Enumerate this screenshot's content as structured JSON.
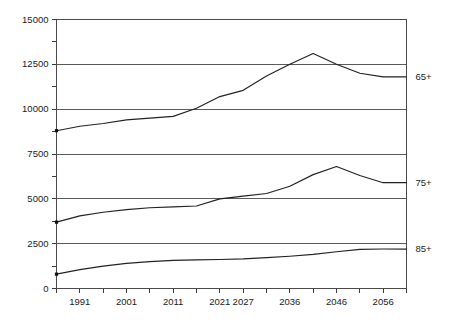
{
  "chart_data": {
    "type": "line",
    "title": "",
    "subtitle": "",
    "xlabel": "",
    "ylabel": "",
    "xlim": [
      1986,
      2061
    ],
    "ylim": [
      0,
      15000
    ],
    "grid": true,
    "grid_axis": "y",
    "legend_position": "right-of-plot-inline",
    "y_ticks_major": [
      0,
      2500,
      5000,
      7500,
      10000,
      12500,
      15000
    ],
    "y_tick_labels": [
      "0",
      "2500",
      "5000",
      "7500",
      "10000",
      "12500",
      "15000"
    ],
    "y_ticks_minor": [
      1250,
      3750,
      6250,
      8750,
      11250,
      13750
    ],
    "x_ticks": [
      1986,
      1991,
      1996,
      2001,
      2006,
      2011,
      2016,
      2021,
      2027,
      2031,
      2036,
      2041,
      2046,
      2051,
      2056,
      2061
    ],
    "x_tick_labels_shown": [
      "1991",
      "2001",
      "2011",
      "2021",
      "2027",
      "2036",
      "2046",
      "2056"
    ],
    "x_tick_label_values": [
      1991,
      2001,
      2011,
      2021,
      2027,
      2036,
      2046,
      2056
    ],
    "series": [
      {
        "name": "65+",
        "label": "65+",
        "marker_at_start": true,
        "x": [
          1986,
          1991,
          1996,
          2001,
          2006,
          2011,
          2016,
          2021,
          2026,
          2031,
          2036,
          2041,
          2046,
          2051,
          2056,
          2061
        ],
        "values": [
          8800,
          9050,
          9200,
          9400,
          9500,
          9600,
          10050,
          10700,
          11050,
          11850,
          12500,
          13100,
          12500,
          12000,
          11800,
          11800
        ]
      },
      {
        "name": "75+",
        "label": "75+",
        "marker_at_start": true,
        "x": [
          1986,
          1991,
          1996,
          2001,
          2006,
          2011,
          2016,
          2021,
          2026,
          2031,
          2036,
          2041,
          2046,
          2051,
          2056,
          2061
        ],
        "values": [
          3700,
          4050,
          4250,
          4400,
          4500,
          4550,
          4600,
          5000,
          5150,
          5300,
          5700,
          6350,
          6800,
          6300,
          5900,
          5900
        ]
      },
      {
        "name": "85+",
        "label": "85+",
        "marker_at_start": true,
        "x": [
          1986,
          1991,
          1996,
          2001,
          2006,
          2011,
          2016,
          2021,
          2026,
          2031,
          2036,
          2041,
          2046,
          2051,
          2056,
          2061
        ],
        "values": [
          800,
          1050,
          1250,
          1400,
          1500,
          1570,
          1600,
          1620,
          1650,
          1720,
          1800,
          1900,
          2050,
          2180,
          2200,
          2200
        ]
      }
    ],
    "colors": {
      "line": "#222222",
      "grid": "#5a5a5a",
      "axis": "#4a4a4a",
      "text": "#1a1a1a",
      "background": "#ffffff"
    }
  }
}
